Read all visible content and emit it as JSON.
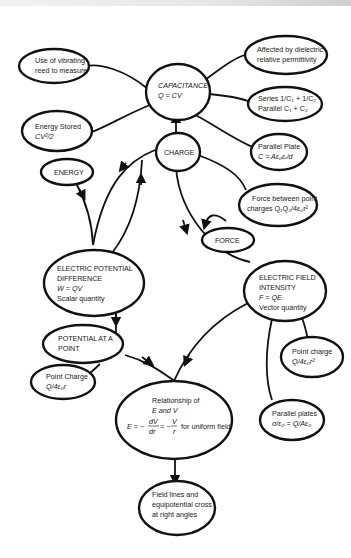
{
  "diagram": {
    "nodes": {
      "capacitance": {
        "label": "CAPACITANCE",
        "formula": "Q = CV"
      },
      "vibrating_reed": {
        "line1": "Use of vibrating",
        "line2": "reed to measure"
      },
      "energy_stored": {
        "line1": "Energy Stored",
        "line2": "CV²/2"
      },
      "dielectric": {
        "line1": "Affected by dielectric",
        "line2": "relative permittivity"
      },
      "series_parallel": {
        "line1": "Series 1/C₁ + 1/C₂",
        "line2": "Parallel C₁ + C₂"
      },
      "charge": {
        "label": "CHARGE"
      },
      "parallel_plate": {
        "line1": "Parallel Plate",
        "line2": "C = Aε₀εᵣ/d"
      },
      "energy": {
        "label": "ENERGY"
      },
      "force_point_charges": {
        "line1": "Force between point",
        "line2": "charges Q₁Q₂/4ε₀r²"
      },
      "force": {
        "label": "FORCE"
      },
      "potential_difference": {
        "line1": "ELECTRIC POTENTIAL",
        "line2": "DIFFERENCE",
        "line3": "W = QV",
        "line4": "Scalar quantity"
      },
      "field_intensity": {
        "line1": "ELECTRIC FIELD",
        "line2": "INTENSITY",
        "line3": "F = QE",
        "line4": "Vector quantity"
      },
      "potential_at_point": {
        "line1": "POTENTIAL AT A",
        "line2": "POINT"
      },
      "point_charge_potential": {
        "line1": "Point Charge",
        "line2": "Q/4ε₀r"
      },
      "point_charge_field": {
        "line1": "Point charge",
        "line2": "Q/4ε₀r²"
      },
      "parallel_plates_field": {
        "line1": "Parallel plates",
        "line2": "σ/ε₀ = Q/Aε₀"
      },
      "relationship": {
        "line1": "Relationship of",
        "line2": "E and V",
        "eq_prefix": "E = −",
        "eq_num1": "dV",
        "eq_den1": "dr",
        "eq_mid": "= −",
        "eq_num2": "V",
        "eq_den2": "r",
        "eq_suffix": "for uniform field"
      },
      "field_lines": {
        "line1": "Field lines and",
        "line2": "equipotential cross",
        "line3": "at right angles"
      }
    },
    "colors": {
      "stroke": "#111111",
      "background": "#ffffff"
    }
  }
}
